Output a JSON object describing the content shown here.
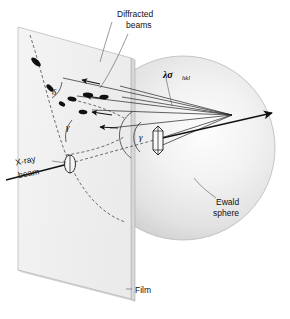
{
  "figure": {
    "kind": "scientific-diagram"
  },
  "labels": {
    "diffracted_beams_line1": "Diffracted",
    "diffracted_beams_line2": "beams",
    "ewald_sphere_line1": "Ewald",
    "ewald_sphere_line2": "sphere",
    "xray_beam_line1": "X-ray",
    "xray_beam_line2": "beam",
    "film": "Film",
    "lambda_sigma": "λσ",
    "lambda_sigma_subscript": "hkl",
    "angle_delta": "δ",
    "angle_gamma_film": "γ",
    "angle_gamma_sphere": "γ"
  },
  "colors": {
    "background": "#ffffff",
    "film_face": "#f1f1f1",
    "film_edge": "#cfcfcf",
    "sphere_light": "#fbfbfb",
    "sphere_mid": "#e6e6e6",
    "sphere_dark": "#c9c9c9",
    "stroke": "#111111",
    "text": "#111111",
    "spot": "#101010"
  },
  "geometry": {
    "film_plane": {
      "corners": [
        [
          18,
          27
        ],
        [
          131,
          58
        ],
        [
          131,
          299
        ],
        [
          18,
          270
        ]
      ],
      "thickness_px": 4
    },
    "sphere": {
      "center_x": 183,
      "center_y": 148,
      "radius": 92
    },
    "crystal": {
      "x": 158,
      "y": 138,
      "width": 9,
      "height": 22
    },
    "ewald_center": {
      "x": 232,
      "y": 115
    },
    "direct_beam": {
      "from": [
        6,
        174
      ],
      "to": [
        272,
        100
      ]
    },
    "diffraction_spots": 7
  },
  "icon_names": {
    "crystal": "crystal-icon",
    "arrowhead": "arrowhead-icon",
    "sphere": "ewald-sphere-icon",
    "film": "film-plane-icon"
  }
}
